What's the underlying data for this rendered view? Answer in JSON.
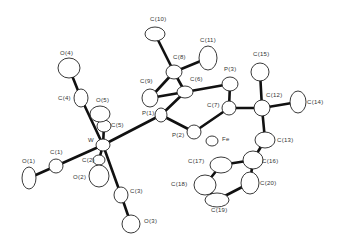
{
  "diagram": {
    "type": "ORTEP molecular structure",
    "atoms": [
      {
        "id": "W",
        "label": "W",
        "x": 103,
        "y": 145,
        "rx": 7,
        "ry": 6,
        "lx": 88,
        "ly": 142
      },
      {
        "id": "C1",
        "label": "C(1)",
        "x": 56,
        "y": 166,
        "rx": 7,
        "ry": 7,
        "lx": 50,
        "ly": 154
      },
      {
        "id": "O1",
        "label": "O(1)",
        "x": 29,
        "y": 178,
        "rx": 7,
        "ry": 11,
        "lx": 22,
        "ly": 163
      },
      {
        "id": "C2",
        "label": "C(2)",
        "x": 99,
        "y": 160,
        "rx": 6,
        "ry": 5,
        "lx": 82,
        "ly": 162
      },
      {
        "id": "O2",
        "label": "O(2)",
        "x": 99,
        "y": 176,
        "rx": 10,
        "ry": 11,
        "lx": 73,
        "ly": 179
      },
      {
        "id": "C3",
        "label": "C(3)",
        "x": 121,
        "y": 195,
        "rx": 7,
        "ry": 8,
        "lx": 130,
        "ly": 193
      },
      {
        "id": "O3",
        "label": "O(3)",
        "x": 131,
        "y": 224,
        "rx": 9,
        "ry": 9,
        "lx": 144,
        "ly": 223
      },
      {
        "id": "C4",
        "label": "C(4)",
        "x": 81,
        "y": 98,
        "rx": 7,
        "ry": 9,
        "lx": 58,
        "ly": 100
      },
      {
        "id": "O4",
        "label": "O(4)",
        "x": 69,
        "y": 68,
        "rx": 11,
        "ry": 10,
        "lx": 60,
        "ly": 55
      },
      {
        "id": "C5",
        "label": "C(5)",
        "x": 104,
        "y": 126,
        "rx": 7,
        "ry": 6,
        "lx": 111,
        "ly": 127
      },
      {
        "id": "O5",
        "label": "O(5)",
        "x": 100,
        "y": 114,
        "rx": 10,
        "ry": 8,
        "lx": 96,
        "ly": 102
      },
      {
        "id": "P1",
        "label": "P(1)",
        "x": 161,
        "y": 115,
        "rx": 6,
        "ry": 7,
        "lx": 142,
        "ly": 115
      },
      {
        "id": "P2",
        "label": "P(2)",
        "x": 194,
        "y": 132,
        "rx": 7,
        "ry": 7,
        "lx": 172,
        "ly": 137
      },
      {
        "id": "P3",
        "label": "P(3)",
        "x": 230,
        "y": 84,
        "rx": 8,
        "ry": 7,
        "lx": 224,
        "ly": 71
      },
      {
        "id": "C6",
        "label": "C(6)",
        "x": 185,
        "y": 92,
        "rx": 8,
        "ry": 6,
        "lx": 190,
        "ly": 81
      },
      {
        "id": "C7",
        "label": "C(7)",
        "x": 229,
        "y": 108,
        "rx": 7,
        "ry": 7,
        "lx": 207,
        "ly": 107
      },
      {
        "id": "C8",
        "label": "C(8)",
        "x": 174,
        "y": 72,
        "rx": 8,
        "ry": 7,
        "lx": 173,
        "ly": 59
      },
      {
        "id": "C9",
        "label": "C(9)",
        "x": 150,
        "y": 98,
        "rx": 8,
        "ry": 9,
        "lx": 140,
        "ly": 83
      },
      {
        "id": "C10",
        "label": "C(10)",
        "x": 155,
        "y": 34,
        "rx": 10,
        "ry": 7,
        "lx": 150,
        "ly": 21
      },
      {
        "id": "C11",
        "label": "C(11)",
        "x": 208,
        "y": 58,
        "rx": 9,
        "ry": 12,
        "lx": 200,
        "ly": 42
      },
      {
        "id": "C12",
        "label": "C(12)",
        "x": 262,
        "y": 108,
        "rx": 8,
        "ry": 8,
        "lx": 266,
        "ly": 97
      },
      {
        "id": "C13",
        "label": "C(13)",
        "x": 265,
        "y": 140,
        "rx": 10,
        "ry": 8,
        "lx": 277,
        "ly": 142
      },
      {
        "id": "C14",
        "label": "C(14)",
        "x": 298,
        "y": 102,
        "rx": 8,
        "ry": 11,
        "lx": 307,
        "ly": 104
      },
      {
        "id": "C15",
        "label": "C(15)",
        "x": 260,
        "y": 72,
        "rx": 9,
        "ry": 9,
        "lx": 253,
        "ly": 56
      },
      {
        "id": "C16",
        "label": "C(16)",
        "x": 253,
        "y": 160,
        "rx": 10,
        "ry": 9,
        "lx": 262,
        "ly": 163
      },
      {
        "id": "C17",
        "label": "C(17)",
        "x": 221,
        "y": 165,
        "rx": 11,
        "ry": 8,
        "lx": 188,
        "ly": 163
      },
      {
        "id": "C18",
        "label": "C(18)",
        "x": 205,
        "y": 185,
        "rx": 11,
        "ry": 10,
        "lx": 171,
        "ly": 186
      },
      {
        "id": "C19",
        "label": "C(19)",
        "x": 217,
        "y": 200,
        "rx": 12,
        "ry": 7,
        "lx": 211,
        "ly": 212
      },
      {
        "id": "C20",
        "label": "C(20)",
        "x": 250,
        "y": 183,
        "rx": 9,
        "ry": 11,
        "lx": 260,
        "ly": 185
      },
      {
        "id": "Fe",
        "label": "Fe",
        "x": 212,
        "y": 141,
        "rx": 6,
        "ry": 5,
        "lx": 222,
        "ly": 141
      }
    ],
    "bonds": [
      [
        "W",
        "C1"
      ],
      [
        "C1",
        "O1"
      ],
      [
        "W",
        "C2"
      ],
      [
        "W",
        "C3"
      ],
      [
        "C3",
        "O3"
      ],
      [
        "W",
        "C4"
      ],
      [
        "C4",
        "O4"
      ],
      [
        "W",
        "C5"
      ],
      [
        "W",
        "P1"
      ],
      [
        "P1",
        "C6"
      ],
      [
        "P1",
        "P2"
      ],
      [
        "P2",
        "C7"
      ],
      [
        "C6",
        "P3"
      ],
      [
        "P3",
        "C7"
      ],
      [
        "C6",
        "C8"
      ],
      [
        "C8",
        "C9"
      ],
      [
        "C8",
        "C10"
      ],
      [
        "C8",
        "C11"
      ],
      [
        "C7",
        "C12"
      ],
      [
        "C12",
        "C14"
      ],
      [
        "C12",
        "C15"
      ],
      [
        "C12",
        "C13"
      ],
      [
        "C13",
        "C16"
      ],
      [
        "C16",
        "C17"
      ],
      [
        "C17",
        "C18"
      ],
      [
        "C18",
        "C19"
      ],
      [
        "C19",
        "C20"
      ],
      [
        "C20",
        "C16"
      ],
      [
        "C6",
        "C9"
      ]
    ]
  }
}
